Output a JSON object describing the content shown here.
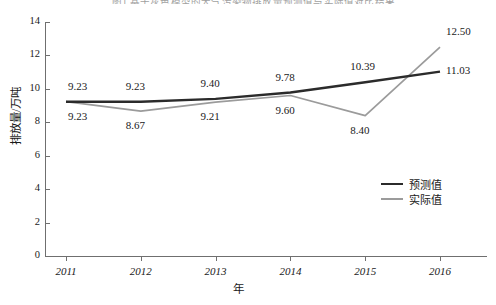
{
  "caption_fragment": "图1 基于灰色模型的大气污染物排放量预测值与实际值对比结果",
  "legend": {
    "position": "inside-right",
    "items": [
      {
        "label": "预测值",
        "color": "#2b2b2b"
      },
      {
        "label": "实际值",
        "color": "#9b9b9b"
      }
    ]
  },
  "axes": {
    "ylabel": "排放量/万吨",
    "xlabel": "年",
    "yticks": [
      "0",
      "2",
      "4",
      "6",
      "8",
      "10",
      "12",
      "14"
    ],
    "xticks": [
      "2011",
      "2012",
      "2013",
      "2014",
      "2015",
      "2016"
    ]
  },
  "chart_data": {
    "type": "line",
    "title": "",
    "xlabel": "年",
    "ylabel": "排放量/万吨",
    "x": [
      2011,
      2012,
      2013,
      2014,
      2015,
      2016
    ],
    "categories": [
      "2011",
      "2012",
      "2013",
      "2014",
      "2015",
      "2016"
    ],
    "xlim": [
      2011,
      2016
    ],
    "ylim": [
      0,
      14
    ],
    "ytick_step": 2,
    "grid": false,
    "legend_position": "inside-right",
    "series": [
      {
        "name": "预测值",
        "color": "#2b2b2b",
        "label_position": "above",
        "values": [
          9.23,
          9.23,
          9.4,
          9.78,
          10.39,
          11.03
        ],
        "labels": [
          "9.23",
          "9.23",
          "9.40",
          "9.78",
          "10.39",
          "11.03"
        ]
      },
      {
        "name": "实际值",
        "color": "#9b9b9b",
        "label_position": "below",
        "values": [
          9.23,
          8.67,
          9.21,
          9.6,
          8.4,
          12.5
        ],
        "labels": [
          "9.23",
          "8.67",
          "9.21",
          "9.60",
          "8.40",
          "12.50"
        ]
      }
    ]
  }
}
